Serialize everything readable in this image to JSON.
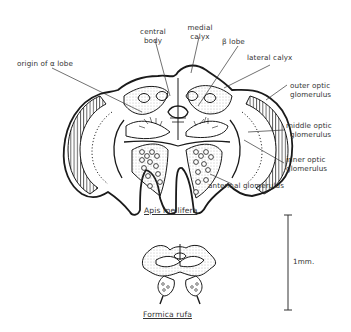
{
  "figure": {
    "specimens": [
      {
        "name": "Apis mellifera",
        "caption": "Apis mellifera"
      },
      {
        "name": "Formica rufa",
        "caption": "Formica rufa"
      }
    ],
    "labels": {
      "origin_alpha_lobe": "origin of α lobe",
      "central_body_1": "central",
      "central_body_2": "body",
      "medial_calyx_1": "medial",
      "medial_calyx_2": "calyx",
      "beta_lobe": "β lobe",
      "lateral_calyx": "lateral calyx",
      "outer_optic_1": "outer optic",
      "outer_optic_2": "glomerulus",
      "middle_optic_1": "middle optic",
      "middle_optic_2": "glomerulus",
      "inner_optic_1": "inner optic",
      "inner_optic_2": "glomerulus",
      "antennal_glomerulus": "antennal glomerulus"
    },
    "scale_bar": {
      "label": "1mm."
    },
    "colors": {
      "ink": "#1a1a1a",
      "stipple": "#bdbdbd",
      "background": "#ffffff"
    }
  }
}
